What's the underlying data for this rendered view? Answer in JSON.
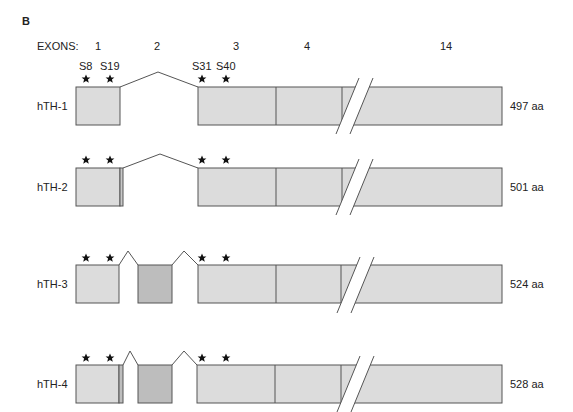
{
  "panel_label": "B",
  "header": {
    "exons_label": "EXONS:",
    "exon_numbers": [
      {
        "label": "1",
        "x": 98
      },
      {
        "label": "2",
        "x": 157
      },
      {
        "label": "3",
        "x": 236
      },
      {
        "label": "4",
        "x": 307
      },
      {
        "label": "14",
        "x": 445
      }
    ]
  },
  "phospho_sites": [
    "S8",
    "S19",
    "S31",
    "S40"
  ],
  "isoforms": [
    {
      "name": "hTH-1",
      "length": "497 aa",
      "exon1_extra": false,
      "exon2": false
    },
    {
      "name": "hTH-2",
      "length": "501 aa",
      "exon1_extra": true,
      "exon2": false
    },
    {
      "name": "hTH-3",
      "length": "524 aa",
      "exon1_extra": false,
      "exon2": true
    },
    {
      "name": "hTH-4",
      "length": "528 aa",
      "exon1_extra": true,
      "exon2": true
    }
  ],
  "colors": {
    "exon_fill": "#dcdcdc",
    "exon2_fill": "#bdbdbd",
    "stroke": "#555555",
    "text": "#222222"
  }
}
